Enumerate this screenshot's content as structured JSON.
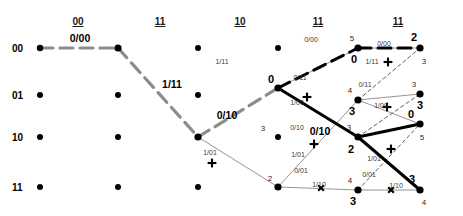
{
  "diagram": {
    "colors": {
      "survivor_gray": "#8c8c8c",
      "survivor_black": "#000000",
      "thin_branch": "#7a7a7a",
      "node": "#000000"
    },
    "column_headers": [
      {
        "label": "00",
        "x": 78
      },
      {
        "label": "11",
        "x": 160
      },
      {
        "label": "10",
        "x": 240
      },
      {
        "label": "11",
        "x": 318
      },
      {
        "label": "11",
        "x": 398
      }
    ],
    "row_labels": [
      {
        "label": "00",
        "y": 48
      },
      {
        "label": "01",
        "y": 95
      },
      {
        "label": "10",
        "y": 137
      },
      {
        "label": "11",
        "y": 187
      }
    ],
    "nodes": [
      {
        "x": 40,
        "y": 48,
        "r": 3.2
      },
      {
        "x": 40,
        "y": 95,
        "r": 3.0
      },
      {
        "x": 40,
        "y": 137,
        "r": 3.0
      },
      {
        "x": 40,
        "y": 187,
        "r": 3.0
      },
      {
        "x": 118,
        "y": 48,
        "r": 3.6
      },
      {
        "x": 118,
        "y": 95,
        "r": 3.0
      },
      {
        "x": 118,
        "y": 137,
        "r": 3.0
      },
      {
        "x": 118,
        "y": 187,
        "r": 3.0
      },
      {
        "x": 198,
        "y": 48,
        "r": 3.0
      },
      {
        "x": 198,
        "y": 95,
        "r": 3.0
      },
      {
        "x": 198,
        "y": 137,
        "r": 3.6
      },
      {
        "x": 198,
        "y": 187,
        "r": 3.0
      },
      {
        "x": 278,
        "y": 48,
        "r": 3.0
      },
      {
        "x": 278,
        "y": 88,
        "r": 3.6
      },
      {
        "x": 278,
        "y": 137,
        "r": 3.0
      },
      {
        "x": 278,
        "y": 187,
        "r": 3.6
      },
      {
        "x": 358,
        "y": 48,
        "r": 3.6
      },
      {
        "x": 358,
        "y": 100,
        "r": 3.6
      },
      {
        "x": 358,
        "y": 137,
        "r": 3.6
      },
      {
        "x": 358,
        "y": 190,
        "r": 3.6
      },
      {
        "x": 420,
        "y": 48,
        "r": 3.6
      },
      {
        "x": 420,
        "y": 94,
        "r": 3.6
      },
      {
        "x": 420,
        "y": 124,
        "r": 3.6
      },
      {
        "x": 420,
        "y": 190,
        "r": 3.6
      }
    ],
    "branch_labels_major": [
      {
        "text": "0/00",
        "x": 80,
        "y": 38
      },
      {
        "text": "1/11",
        "x": 172,
        "y": 84
      },
      {
        "text": "0/10",
        "x": 227,
        "y": 115
      },
      {
        "text": "0/10",
        "x": 320,
        "y": 131
      }
    ],
    "branch_labels_minor": [
      {
        "text": "1/11",
        "x": 222,
        "y": 61
      },
      {
        "text": "1/01",
        "x": 210,
        "y": 152
      },
      {
        "text": "0/11",
        "x": 300,
        "y": 77
      },
      {
        "text": "1/00",
        "x": 297,
        "y": 102
      },
      {
        "text": "0/10",
        "x": 297,
        "y": 127
      },
      {
        "text": "1/01",
        "x": 298,
        "y": 154
      },
      {
        "text": "0/01",
        "x": 301,
        "y": 170
      },
      {
        "text": "1/10",
        "x": 319,
        "y": 184
      },
      {
        "text": "0/00",
        "x": 311,
        "y": 39
      },
      {
        "text": "0/00",
        "x": 384,
        "y": 43
      },
      {
        "text": "1/11",
        "x": 372,
        "y": 61
      },
      {
        "text": "0/11",
        "x": 365,
        "y": 84
      },
      {
        "text": "1/00",
        "x": 381,
        "y": 105
      },
      {
        "text": "1/01",
        "x": 374,
        "y": 158
      },
      {
        "text": "0/01",
        "x": 369,
        "y": 174
      },
      {
        "text": "1/10",
        "x": 396,
        "y": 185
      }
    ],
    "metrics": [
      {
        "text": "0",
        "x": 271,
        "y": 79,
        "size": "big"
      },
      {
        "text": "3",
        "x": 263,
        "y": 128,
        "size": "small"
      },
      {
        "text": "2",
        "x": 270,
        "y": 178,
        "size": "small"
      },
      {
        "text": "5",
        "x": 352,
        "y": 38,
        "size": "small"
      },
      {
        "text": "0",
        "x": 354,
        "y": 59,
        "size": "big"
      },
      {
        "text": "4",
        "x": 350,
        "y": 90,
        "size": "small"
      },
      {
        "text": "3",
        "x": 352,
        "y": 111,
        "size": "big"
      },
      {
        "text": "3",
        "x": 349,
        "y": 127,
        "size": "small"
      },
      {
        "text": "2",
        "x": 351,
        "y": 149,
        "size": "big"
      },
      {
        "text": "4",
        "x": 350,
        "y": 180,
        "size": "small"
      },
      {
        "text": "3",
        "x": 353,
        "y": 201,
        "size": "big"
      },
      {
        "text": "2",
        "x": 414,
        "y": 37,
        "size": "big"
      },
      {
        "text": "3",
        "x": 424,
        "y": 61,
        "size": "small"
      },
      {
        "text": "3",
        "x": 414,
        "y": 84,
        "size": "small"
      },
      {
        "text": "3",
        "x": 420,
        "y": 105,
        "size": "big"
      },
      {
        "text": "0",
        "x": 411,
        "y": 114,
        "size": "big"
      },
      {
        "text": "5",
        "x": 422,
        "y": 137,
        "size": "small"
      },
      {
        "text": "3",
        "x": 412,
        "y": 179,
        "size": "big"
      },
      {
        "text": "4",
        "x": 424,
        "y": 202,
        "size": "small"
      }
    ],
    "survivor_gray_path": [
      {
        "x1": 40,
        "y1": 48,
        "x2": 118,
        "y2": 48
      },
      {
        "x1": 118,
        "y1": 48,
        "x2": 198,
        "y2": 137
      },
      {
        "x1": 198,
        "y1": 137,
        "x2": 278,
        "y2": 88
      }
    ],
    "survivor_black_path": [
      {
        "x1": 278,
        "y1": 88,
        "x2": 358,
        "y2": 48
      },
      {
        "x1": 358,
        "y1": 48,
        "x2": 420,
        "y2": 48
      },
      {
        "x1": 278,
        "y1": 88,
        "x2": 358,
        "y2": 137
      },
      {
        "x1": 358,
        "y1": 137,
        "x2": 420,
        "y2": 124
      },
      {
        "x1": 358,
        "y1": 137,
        "x2": 420,
        "y2": 190
      }
    ],
    "thin_branches": [
      {
        "x1": 198,
        "y1": 137,
        "x2": 278,
        "y2": 187
      },
      {
        "x1": 278,
        "y1": 187,
        "x2": 358,
        "y2": 190
      },
      {
        "x1": 278,
        "y1": 187,
        "x2": 358,
        "y2": 100
      },
      {
        "x1": 278,
        "y1": 88,
        "x2": 358,
        "y2": 48
      },
      {
        "x1": 358,
        "y1": 48,
        "x2": 420,
        "y2": 48
      },
      {
        "x1": 358,
        "y1": 100,
        "x2": 420,
        "y2": 124
      },
      {
        "x1": 358,
        "y1": 190,
        "x2": 420,
        "y2": 190
      },
      {
        "x1": 358,
        "y1": 100,
        "x2": 420,
        "y2": 94
      }
    ],
    "dotted_branches": [
      {
        "x1": 358,
        "y1": 100,
        "x2": 420,
        "y2": 48
      },
      {
        "x1": 358,
        "y1": 137,
        "x2": 420,
        "y2": 94
      },
      {
        "x1": 358,
        "y1": 190,
        "x2": 420,
        "y2": 124
      }
    ],
    "pruned_markers": [
      {
        "x": 212,
        "y": 163,
        "kind": "plus"
      },
      {
        "x": 307,
        "y": 97,
        "kind": "plus"
      },
      {
        "x": 314,
        "y": 144,
        "kind": "plus"
      },
      {
        "x": 388,
        "y": 62,
        "kind": "plus"
      },
      {
        "x": 387,
        "y": 107,
        "kind": "plus"
      },
      {
        "x": 391,
        "y": 149,
        "kind": "plus"
      },
      {
        "x": 321,
        "y": 188,
        "kind": "x"
      },
      {
        "x": 391,
        "y": 190,
        "kind": "x"
      }
    ]
  }
}
